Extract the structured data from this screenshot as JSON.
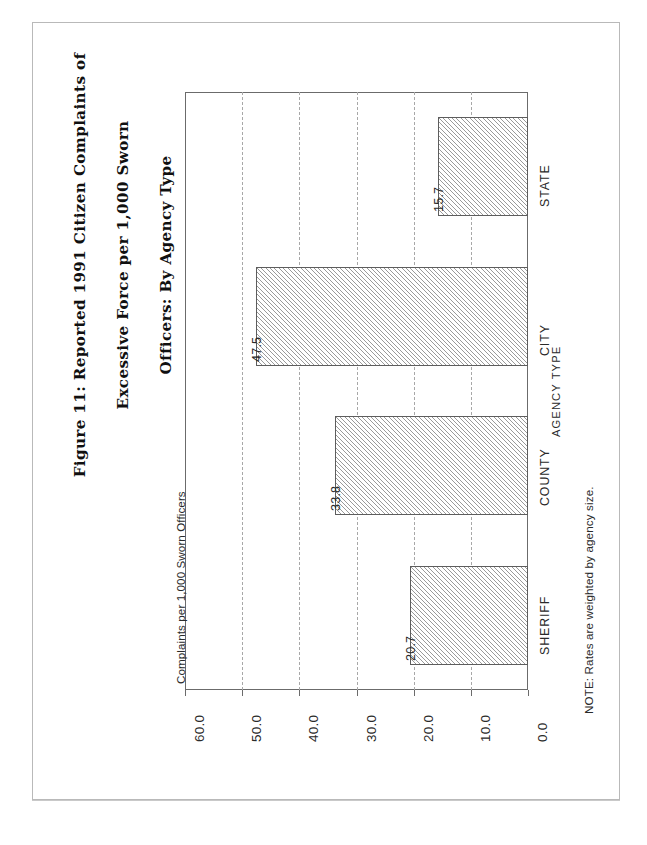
{
  "page": {
    "background_color": "#ffffff",
    "border_color": "#b9b9b9"
  },
  "figure": {
    "title": "Figure 11: Reported 1991 Citizen Complaints of\nExcessive Force per 1,000 Sworn\nOfficers: By Agency Type",
    "title_line_1": "Figure 11: Reported 1991 Citizen Complaints of",
    "title_line_2": "Excessive Force per 1,000 Sworn",
    "title_line_3": "Officers: By Agency Type",
    "note": "NOTE: Rates are weighted by agency size."
  },
  "chart_data": {
    "type": "bar",
    "orientation": "vertical",
    "title": "Figure 11: Reported 1991 Citizen Complaints of Excessive Force per 1,000 Sworn Officers: By Agency Type",
    "categories": [
      "SHERIFF",
      "COUNTY",
      "CITY",
      "STATE"
    ],
    "values": [
      20.7,
      33.8,
      47.5,
      15.7
    ],
    "data_labels": [
      "20.7",
      "33.8",
      "47.5",
      "15.7"
    ],
    "xlabel": "AGENCY TYPE",
    "ylabel": "Complaints per 1,000 Sworn Officers",
    "ylim": [
      0.0,
      60.0
    ],
    "yticks": [
      0.0,
      10.0,
      20.0,
      30.0,
      40.0,
      50.0,
      60.0
    ],
    "ytick_labels": [
      "0.0",
      "10.0",
      "20.0",
      "30.0",
      "40.0",
      "50.0",
      "60.0"
    ],
    "grid": true,
    "grid_style": "dashed",
    "grid_color": "#a8a8a8",
    "legend": null,
    "bar_fill": "diagonal-hatch",
    "bar_fill_color": "#9a9a9a",
    "bar_border_color": "#5d5d5d",
    "note": "NOTE: Rates are weighted by agency size."
  }
}
